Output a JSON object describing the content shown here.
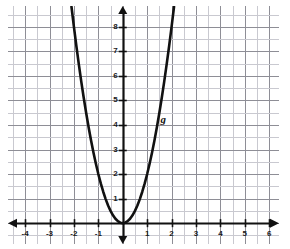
{
  "chart_data": {
    "type": "line",
    "title": "",
    "subtitle": "",
    "xlabel": "",
    "ylabel": "",
    "xlim": [
      -4.7,
      6.4
    ],
    "ylim": [
      -0.85,
      8.85
    ],
    "grid": true,
    "grid_step": 0.5,
    "legend_position": "inline-annotation",
    "x_tick_labels": [
      "-4",
      "-3",
      "-2",
      "-1",
      "1",
      "2",
      "3",
      "4",
      "5",
      "6"
    ],
    "x_tick_values": [
      -4,
      -3,
      -2,
      -1,
      1,
      2,
      3,
      4,
      5,
      6
    ],
    "y_tick_labels": [
      "1",
      "2",
      "3",
      "4",
      "5",
      "6",
      "7",
      "8"
    ],
    "y_tick_values": [
      1,
      2,
      3,
      4,
      5,
      6,
      7,
      8
    ],
    "series": [
      {
        "name": "g",
        "equation": "y = 2x^2",
        "vertex": [
          0,
          0
        ],
        "color": "#111111",
        "x": [
          -2.1,
          -2.0,
          -1.9,
          -1.8,
          -1.7,
          -1.6,
          -1.5,
          -1.4,
          -1.3,
          -1.2,
          -1.1,
          -1.0,
          -0.9,
          -0.8,
          -0.7,
          -0.6,
          -0.5,
          -0.4,
          -0.3,
          -0.2,
          -0.1,
          0.0,
          0.1,
          0.2,
          0.3,
          0.4,
          0.5,
          0.6,
          0.7,
          0.8,
          0.9,
          1.0,
          1.1,
          1.2,
          1.3,
          1.4,
          1.5,
          1.6,
          1.7,
          1.8,
          1.9,
          2.0,
          2.1
        ],
        "values": [
          8.82,
          8.0,
          7.22,
          6.48,
          5.78,
          5.12,
          4.5,
          3.92,
          3.38,
          2.88,
          2.42,
          2.0,
          1.62,
          1.28,
          0.98,
          0.72,
          0.5,
          0.32,
          0.18,
          0.08,
          0.02,
          0.0,
          0.02,
          0.08,
          0.18,
          0.32,
          0.5,
          0.72,
          0.98,
          1.28,
          1.62,
          2.0,
          2.42,
          2.88,
          3.38,
          3.92,
          4.5,
          5.12,
          5.78,
          6.48,
          7.22,
          8.0,
          8.82
        ]
      }
    ],
    "annotations": [
      {
        "text": "g",
        "x": 1.55,
        "y": 4.45,
        "name": "curve-label-g"
      }
    ],
    "colors": {
      "curve": "#111111",
      "axis": "#111111",
      "grid_major": "#8e8e96",
      "grid_minor": "#c9c9d0",
      "tick_label": "#1a1a1a",
      "background": "#ffffff"
    }
  }
}
